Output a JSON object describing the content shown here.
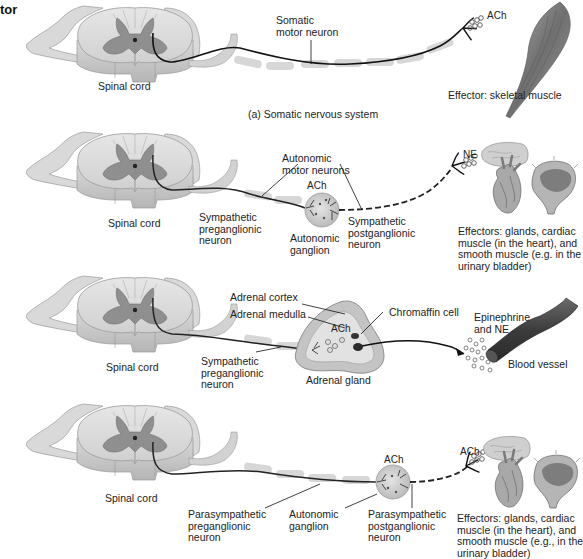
{
  "figure": {
    "heading_fragment": "tor",
    "panels": [
      {
        "id": "somatic",
        "spinal_cord_label": "Spinal cord",
        "neuron_label": "Somatic\nmotor neuron",
        "neurotransmitter": "ACh",
        "effector_label": "Effector: skeletal muscle",
        "caption": "(a) Somatic nervous system"
      },
      {
        "id": "sympathetic",
        "spinal_cord_label": "Spinal cord",
        "autonomic_motor_neurons_label": "Autonomic\nmotor neurons",
        "ganglion_neurotransmitter": "ACh",
        "preganglionic_label": "Sympathetic\npreganglionic\nneuron",
        "ganglion_label": "Autonomic\nganglion",
        "postganglionic_label": "Sympathetic\npostganglionic\nneuron",
        "effector_neurotransmitter": "NE",
        "effector_label": "Effectors: glands, cardiac\nmuscle (in the heart), and\nsmooth muscle (e.g. in the\nurinary bladder)"
      },
      {
        "id": "adrenal",
        "spinal_cord_label": "Spinal cord",
        "adrenal_cortex_label": "Adrenal cortex",
        "adrenal_medulla_label": "Adrenal medulla",
        "chromaffin_label": "Chromaffin cell",
        "gland_neurotransmitter": "ACh",
        "preganglionic_label": "Sympathetic\npreganglionic\nneuron",
        "gland_label": "Adrenal gland",
        "hormones_label": "Epinephrine\nand NE",
        "blood_vessel_label": "Blood vessel"
      },
      {
        "id": "parasympathetic",
        "spinal_cord_label": "Spinal cord",
        "ganglion_neurotransmitter": "ACh",
        "preganglionic_label": "Parasympathetic\npreganglionic\nneuron",
        "ganglion_label": "Autonomic\nganglion",
        "postganglionic_label": "Parasympathetic\npostganglionic\nneuron",
        "effector_neurotransmitter": "ACh",
        "effector_label": "Effectors: glands, cardiac\nmuscle (in the heart), and\nsmooth muscle (e.g., in the\nurinary bladder)"
      }
    ]
  },
  "colors": {
    "background": "#ffffff",
    "white_matter": "#dcdcdc",
    "gray_matter": "#8f8f8f",
    "nerve": "#c9c9c9",
    "myelin": "#cfcfcf",
    "axon": "#1a1a1a",
    "ganglion": "#d2d2d2",
    "adrenal": "#bdbdbd",
    "vessel": "#4a4a4a",
    "muscle": "#8a8a8a"
  }
}
